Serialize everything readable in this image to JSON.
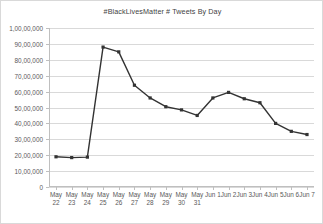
{
  "chart_data": {
    "type": "line",
    "title": "#BlackLivesMatter # Tweets By Day",
    "xlabel": "",
    "ylabel": "",
    "categories": [
      "May 22",
      "May 23",
      "May 24",
      "May 25",
      "May 26",
      "May 27",
      "May 28",
      "May 29",
      "May 30",
      "May 31",
      "Jun 1",
      "Jun 2",
      "Jun 3",
      "Jun 4",
      "Jun 5",
      "Jun 6",
      "Jun 7"
    ],
    "values": [
      1900000,
      1850000,
      1880000,
      8800000,
      8500000,
      6400000,
      5600000,
      5050000,
      4850000,
      4500000,
      5600000,
      5950000,
      5550000,
      5300000,
      4000000,
      3500000,
      3300000
    ],
    "ylim": [
      0,
      10000000
    ],
    "ytick_values": [
      0,
      1000000,
      2000000,
      3000000,
      4000000,
      5000000,
      6000000,
      7000000,
      8000000,
      9000000,
      10000000
    ],
    "ytick_labels": [
      "0",
      "10,00,000",
      "20,00,000",
      "30,00,000",
      "40,00,000",
      "50,00,000",
      "60,00,000",
      "70,00,000",
      "80,00,000",
      "90,00,000",
      "1,00,00,000"
    ],
    "xtick_labels": [
      {
        "line1": "May",
        "line2": "22"
      },
      {
        "line1": "May",
        "line2": "23"
      },
      {
        "line1": "May",
        "line2": "24"
      },
      {
        "line1": "May",
        "line2": "25"
      },
      {
        "line1": "May",
        "line2": "26"
      },
      {
        "line1": "May",
        "line2": "27"
      },
      {
        "line1": "May",
        "line2": "28"
      },
      {
        "line1": "May",
        "line2": "29"
      },
      {
        "line1": "May",
        "line2": "30"
      },
      {
        "line1": "May",
        "line2": "31"
      },
      {
        "line1": "Jun 1",
        "line2": ""
      },
      {
        "line1": "Jun 2",
        "line2": ""
      },
      {
        "line1": "Jun 3",
        "line2": ""
      },
      {
        "line1": "Jun 4",
        "line2": ""
      },
      {
        "line1": "Jun 5",
        "line2": ""
      },
      {
        "line1": "Jun 6",
        "line2": ""
      },
      {
        "line1": "Jun 7",
        "line2": ""
      }
    ],
    "grid": true,
    "legend": false,
    "series_color": "#333333",
    "grid_color": "#d9d9d9",
    "axis_color": "#bfbfbf",
    "text_color": "#595959",
    "title_color": "#3f3f3f",
    "background_color": "#ffffff",
    "border_color": "#d9d9d9"
  }
}
